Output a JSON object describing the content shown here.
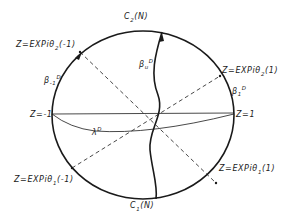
{
  "diagram": {
    "type": "unit-disk contour diagram",
    "colors": {
      "ink": "#1a1a1a",
      "background": "#ffffff"
    },
    "labels": {
      "c2": {
        "main": "C",
        "sub": "2",
        "tail": "(N)"
      },
      "c1": {
        "main": "C",
        "sub": "1",
        "tail": "(N)"
      },
      "z_theta2_minus": {
        "text": "Z=EXPiθ",
        "sub": "2",
        "tail": "(-1)"
      },
      "z_theta2_plus": {
        "text": "Z=EXPiθ",
        "sub": "2",
        "tail": "(1)"
      },
      "z_theta1_minus": {
        "text": "Z=EXPiθ",
        "sub": "1",
        "tail": "(-1)"
      },
      "z_theta1_plus": {
        "text": "Z=EXPiθ",
        "sub": "1",
        "tail": "(1)"
      },
      "z_minus_one": {
        "text": "Z=-1"
      },
      "z_one": {
        "text": "Z=1"
      },
      "beta_minus": {
        "main": "β",
        "sub": "-1",
        "sup": "D"
      },
      "beta_plus": {
        "main": "β",
        "sub": "1",
        "sup": "D"
      },
      "beta_u": {
        "main": "β",
        "sub": "u",
        "sup": "D"
      },
      "lambda": {
        "main": "λ",
        "sup": "D"
      }
    }
  }
}
